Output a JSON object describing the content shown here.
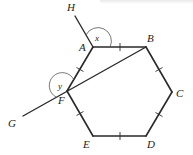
{
  "figure": {
    "vertices": [
      "A",
      "B",
      "C",
      "D",
      "E",
      "F"
    ],
    "points": {
      "A": "A",
      "B": "B",
      "C": "C",
      "D": "D",
      "E": "E",
      "F": "F",
      "G": "G",
      "H": "H"
    },
    "angles": {
      "x": "x",
      "y": "y"
    },
    "congruent_sides": [
      "AB",
      "BC",
      "CD",
      "DE",
      "EF",
      "FA"
    ],
    "segments": [
      "AB",
      "BC",
      "CD",
      "DE",
      "EF",
      "FA",
      "BF",
      "FG",
      "AH"
    ]
  }
}
